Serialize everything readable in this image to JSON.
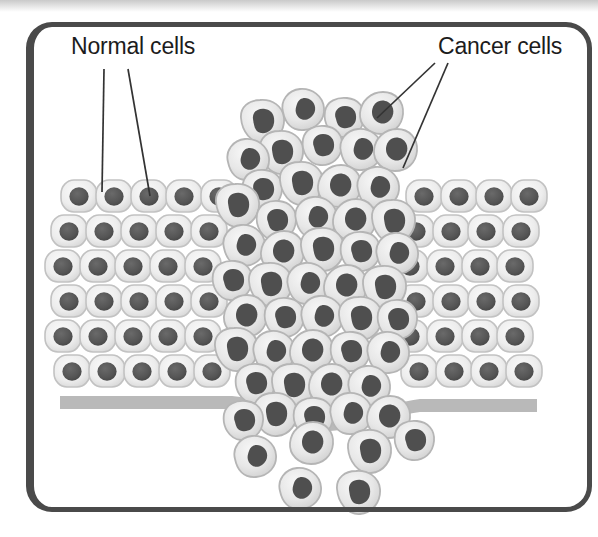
{
  "figure": {
    "type": "biological-diagram",
    "background_color": "#ffffff",
    "frame": {
      "color": "#4a4a4a",
      "shape": "rounded-rectangle"
    }
  },
  "labels": {
    "normal_cells": "Normal cells",
    "cancer_cells": "Cancer cells"
  },
  "colors": {
    "normal_cell_fill": "#ededed",
    "normal_cell_stroke": "#c4c4c4",
    "nucleus": "#555555",
    "cancer_cell_fill": "#e6e6e6",
    "cancer_cell_stroke": "#b8b8b8",
    "cancer_nucleus": "#4f4f4f",
    "basement_membrane": "#b9b9b9",
    "leader_line": "#333333",
    "label_text": "#1c1c1c"
  },
  "annotations": {
    "normal_cells_leader_count": 2,
    "cancer_cells_leader_count": 2
  },
  "structure": {
    "epithelium_rows": 6,
    "normal_cell_columns": 14,
    "basement_membrane_label": "basement membrane",
    "invading_cluster_label": "cancer cell mass breaking through membrane",
    "escaped_cells_label": "metastasizing cells below membrane"
  }
}
